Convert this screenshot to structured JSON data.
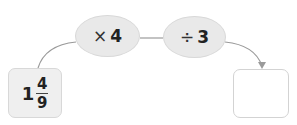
{
  "start_value": {
    "whole": "1",
    "numerator": "4",
    "denominator": "9"
  },
  "operations": [
    {
      "symbol": "×",
      "operand": "4"
    },
    {
      "symbol": "÷",
      "operand": "3"
    }
  ],
  "result_value": "",
  "colors": {
    "node_fill": "#e9e9e9",
    "border": "#d8d8d8",
    "line": "#9a9a9a"
  }
}
